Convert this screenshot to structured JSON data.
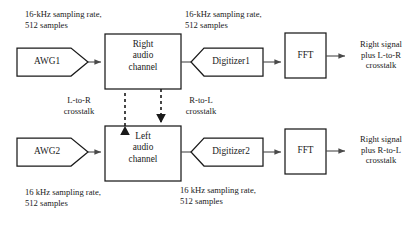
{
  "diagram": {
    "colors": {
      "background": "#ffffff",
      "outline": "#1a1a1a",
      "flow_line": "#4a4a4a",
      "text": "#1a1a1a"
    },
    "nodes": {
      "awg1": "AWG1",
      "awg2": "AWG2",
      "right_channel": "Right\naudio\nchannel",
      "left_channel": "Left\naudio\nchannel",
      "digitizer1": "Digitizer1",
      "digitizer2": "Digitizer2",
      "fft_top": "FFT",
      "fft_bottom": "FFT"
    },
    "annotations": {
      "top_left_rate": "16-kHz sampling rate,\n512 samples",
      "top_right_rate": "16-kHz sampling rate,\n512 samples",
      "bottom_left_rate": "16 kHz sampling rate,\n512 samples",
      "bottom_right_rate": "16 kHz sampling rate,\n512 samples",
      "crosstalk_l_to_r": "L-to-R\ncrosstalk",
      "crosstalk_r_to_l": "R-to-L\ncrosstalk",
      "output_top": "Right signal\nplus L-to-R\ncrosstalk",
      "output_bottom": "Right signal\nplus R-to-L\ncrosstalk"
    }
  }
}
